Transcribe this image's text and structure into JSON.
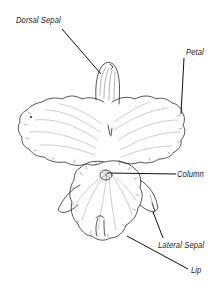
{
  "diagram": {
    "labels": [
      {
        "id": "dorsal-sepal",
        "text": "Dorsal Sepal"
      },
      {
        "id": "petal",
        "text": "Petal"
      },
      {
        "id": "column",
        "text": "Column"
      },
      {
        "id": "lateral-sepal",
        "text": "Lateral Sepal"
      },
      {
        "id": "lip",
        "text": "Lip"
      }
    ]
  }
}
